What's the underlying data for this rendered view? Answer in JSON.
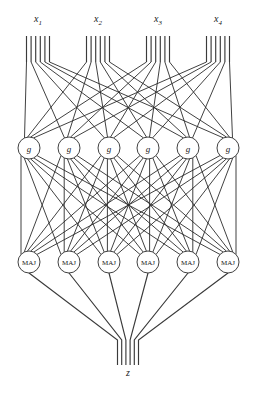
{
  "figure": {
    "title": "",
    "background_color": "#ffffff",
    "line_color": "#2b2b2b",
    "width": 256,
    "height": 395
  },
  "inputs": {
    "count": 4,
    "wires_per_input": 6,
    "labels": [
      {
        "base": "x",
        "sub": "1",
        "x": 38,
        "y": 22
      },
      {
        "base": "x",
        "sub": "2",
        "x": 98,
        "y": 22
      },
      {
        "base": "x",
        "sub": "3",
        "x": 158,
        "y": 22
      },
      {
        "base": "x",
        "sub": "4",
        "x": 218,
        "y": 22
      }
    ],
    "bundle_centers": [
      38,
      98,
      158,
      218
    ],
    "bundle_spacing": 4.6,
    "bus_top_y": 36,
    "bus_bottom_y": 62
  },
  "layer_g": {
    "label": "g",
    "count": 6,
    "radius": 11,
    "center_y": 148,
    "centers_x": [
      29,
      69,
      109,
      148,
      188,
      228
    ],
    "nodes": [
      {
        "label": "g",
        "cx": 29,
        "cy": 148
      },
      {
        "label": "g",
        "cx": 69,
        "cy": 148
      },
      {
        "label": "g",
        "cx": 109,
        "cy": 148
      },
      {
        "label": "g",
        "cx": 148,
        "cy": 148
      },
      {
        "label": "g",
        "cx": 188,
        "cy": 148
      },
      {
        "label": "g",
        "cx": 228,
        "cy": 148
      }
    ]
  },
  "layer_maj": {
    "label": "MAJ",
    "count": 6,
    "radius": 11,
    "center_y": 262,
    "centers_x": [
      29,
      69,
      109,
      148,
      188,
      228
    ],
    "nodes": [
      {
        "label": "MAJ",
        "cx": 29,
        "cy": 262
      },
      {
        "label": "MAJ",
        "cx": 69,
        "cy": 262
      },
      {
        "label": "MAJ",
        "cx": 109,
        "cy": 262
      },
      {
        "label": "MAJ",
        "cx": 148,
        "cy": 262
      },
      {
        "label": "MAJ",
        "cx": 188,
        "cy": 262
      },
      {
        "label": "MAJ",
        "cx": 228,
        "cy": 262
      }
    ]
  },
  "output": {
    "label": "z",
    "label_x": 128,
    "label_y": 376,
    "wires": 6,
    "bundle_center_x": 128,
    "bundle_spacing": 4.2,
    "converge_y": 340,
    "bottom_y": 365
  },
  "connections": {
    "inputs_to_g": "full-fanout-24-to-6",
    "g_to_maj": "complete-bipartite-6x6",
    "maj_to_output": "converge-6-to-1"
  }
}
